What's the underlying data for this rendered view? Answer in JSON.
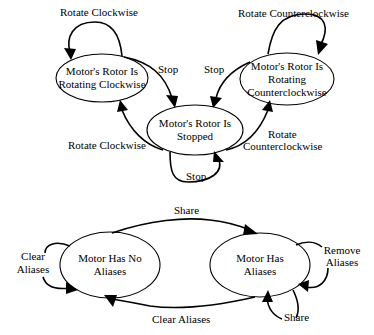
{
  "diagrams": [
    {
      "id": "rotor-state",
      "nodes": [
        {
          "id": "cw",
          "lines": [
            "Motor's Rotor Is",
            "Rotating Clockwise"
          ]
        },
        {
          "id": "ccw",
          "lines": [
            "Motor's Rotor Is",
            "Rotating",
            "Counterclockwise"
          ]
        },
        {
          "id": "stopped",
          "lines": [
            "Motor's Rotor Is",
            "Stopped"
          ]
        }
      ],
      "edges": [
        {
          "from": "cw",
          "to": "cw",
          "label": "Rotate Clockwise"
        },
        {
          "from": "ccw",
          "to": "ccw",
          "label": "Rotate Counterclockwise"
        },
        {
          "from": "cw",
          "to": "stopped",
          "label": "Stop"
        },
        {
          "from": "ccw",
          "to": "stopped",
          "label": "Stop"
        },
        {
          "from": "stopped",
          "to": "cw",
          "label": "Rotate Clockwise"
        },
        {
          "from": "stopped",
          "to": "ccw",
          "label_lines": [
            "Rotate",
            "Counterclockwise"
          ]
        },
        {
          "from": "stopped",
          "to": "stopped",
          "label": "Stop"
        }
      ]
    },
    {
      "id": "alias-state",
      "nodes": [
        {
          "id": "noalias",
          "lines": [
            "Motor Has No",
            "Aliases"
          ]
        },
        {
          "id": "alias",
          "lines": [
            "Motor Has",
            "Aliases"
          ]
        }
      ],
      "edges": [
        {
          "from": "noalias",
          "to": "alias",
          "label": "Share"
        },
        {
          "from": "alias",
          "to": "noalias",
          "label": "Clear Aliases"
        },
        {
          "from": "noalias",
          "to": "noalias",
          "label_lines": [
            "Clear",
            "Aliases"
          ]
        },
        {
          "from": "alias",
          "to": "alias",
          "label_lines": [
            "Remove",
            "Aliases"
          ]
        },
        {
          "from": "alias",
          "to": "alias",
          "label": "Share",
          "note": "self-loop bottom"
        }
      ]
    }
  ]
}
